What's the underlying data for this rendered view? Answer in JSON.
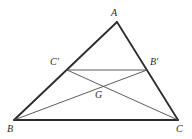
{
  "figure": {
    "background_color": "#ffffff",
    "stroke_color_thick": "#2b2b2b",
    "stroke_color_thin": "#4a4a4a",
    "width": 192,
    "height": 139,
    "points": {
      "A": {
        "label": "A",
        "x": 117,
        "y": 22,
        "role": "apex-vertex"
      },
      "B": {
        "label": "B",
        "x": 14,
        "y": 120,
        "role": "bottom-left-vertex"
      },
      "C": {
        "label": "C",
        "x": 178,
        "y": 120,
        "role": "bottom-right-vertex"
      },
      "Cp": {
        "label": "C'",
        "x": 67,
        "y": 70,
        "role": "midpoint-of-AB"
      },
      "Bp": {
        "label": "B'",
        "x": 147,
        "y": 70,
        "role": "midpoint-of-AC"
      },
      "G": {
        "label": "G",
        "x": 101,
        "y": 88,
        "role": "centroid"
      }
    },
    "segments": [
      {
        "name": "side-AB",
        "from": "A",
        "to": "B",
        "weight": "thick"
      },
      {
        "name": "side-AC",
        "from": "A",
        "to": "C",
        "weight": "thick"
      },
      {
        "name": "side-BC",
        "from": "B",
        "to": "C",
        "weight": "thick"
      },
      {
        "name": "midline-CpBp",
        "from": "Cp",
        "to": "Bp",
        "weight": "thin"
      },
      {
        "name": "median-BBp",
        "from": "B",
        "to": "Bp",
        "weight": "thin"
      },
      {
        "name": "median-CCp",
        "from": "C",
        "to": "Cp",
        "weight": "thin"
      }
    ]
  },
  "labels": {
    "A": "A",
    "B": "B",
    "C": "C",
    "C_prime": "C'",
    "B_prime": "B'",
    "G": "G"
  }
}
